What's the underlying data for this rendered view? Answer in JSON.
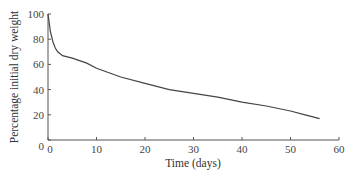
{
  "chart_data": {
    "type": "line",
    "title": "",
    "xlabel": "Time (days)",
    "ylabel": "Percentage initial dry weight",
    "xlim": [
      0,
      60
    ],
    "ylim": [
      0,
      100
    ],
    "x_ticks": [
      "0",
      "10",
      "20",
      "30",
      "40",
      "50",
      "60"
    ],
    "y_ticks": [
      "0",
      "20",
      "40",
      "60",
      "80",
      "100"
    ],
    "grid": false,
    "legend": null,
    "series": [
      {
        "name": "dry weight",
        "x": [
          0,
          0.5,
          1,
          1.5,
          2,
          3,
          5,
          8,
          10,
          15,
          20,
          25,
          30,
          35,
          40,
          45,
          50,
          53,
          56
        ],
        "y": [
          100,
          86,
          78,
          73,
          70,
          67,
          65,
          61,
          57,
          50,
          45,
          40,
          37,
          34,
          30,
          27,
          23,
          20,
          17
        ]
      }
    ]
  }
}
